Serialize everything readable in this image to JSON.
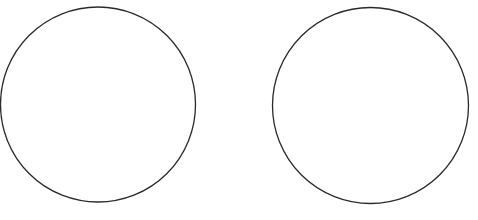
{
  "diagram": {
    "background": "#ffffff",
    "stroke_color": "#2a2a2a",
    "stroke_width": 1.3,
    "shapes": [
      {
        "type": "circle",
        "name": "left-circle",
        "cx": 98,
        "cy": 104.5,
        "r": 97.5
      },
      {
        "type": "circle",
        "name": "right-circle",
        "cx": 370.5,
        "cy": 105.5,
        "r": 98
      }
    ]
  }
}
